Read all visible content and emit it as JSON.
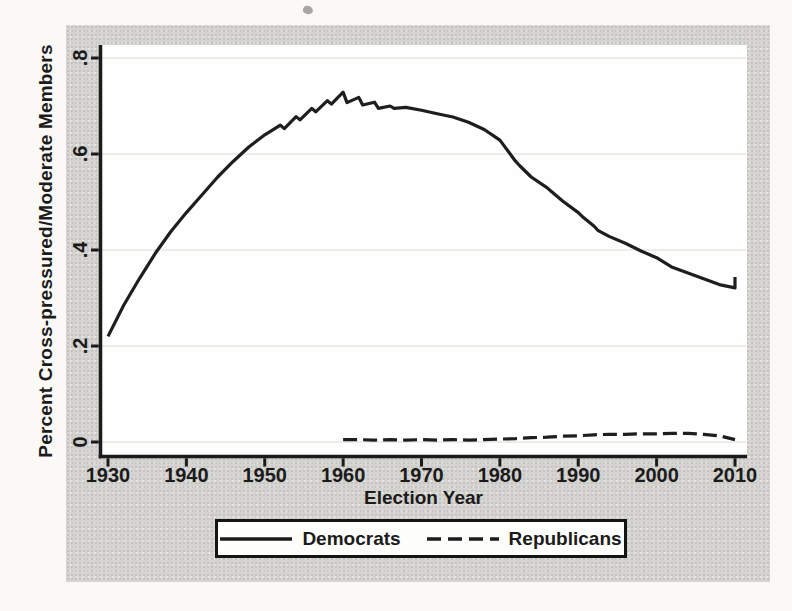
{
  "page": {
    "background": "#faf9f6"
  },
  "figure": {
    "background": "#d5d4d1",
    "plot_background": "#fefefe",
    "axis_color": "#1b1b1b",
    "grid_color": "#eae6e1",
    "line_color": "#1e1e1e"
  },
  "chart_data": {
    "type": "line",
    "title": "",
    "xlabel": "Election Year",
    "ylabel": "Percent Cross-pressured/Moderate Members",
    "xlim": [
      1930,
      2010
    ],
    "ylim": [
      0,
      0.8
    ],
    "xticks": [
      1930,
      1940,
      1950,
      1960,
      1970,
      1980,
      1990,
      2000,
      2010
    ],
    "yticks": [
      0,
      0.2,
      0.4,
      0.6,
      0.8
    ],
    "ytick_labels": [
      "0",
      ".2",
      ".4",
      ".6",
      ".8"
    ],
    "grid": "horizontal",
    "legend_position": "bottom-center",
    "series": [
      {
        "name": "Democrats",
        "style": "solid",
        "color": "#1e1e1e",
        "points": [
          [
            1930,
            0.22
          ],
          [
            1932,
            0.285
          ],
          [
            1934,
            0.34
          ],
          [
            1936,
            0.392
          ],
          [
            1938,
            0.438
          ],
          [
            1940,
            0.478
          ],
          [
            1942,
            0.515
          ],
          [
            1944,
            0.552
          ],
          [
            1946,
            0.585
          ],
          [
            1948,
            0.615
          ],
          [
            1950,
            0.64
          ],
          [
            1952,
            0.66
          ],
          [
            1952.5,
            0.653
          ],
          [
            1954,
            0.678
          ],
          [
            1954.5,
            0.671
          ],
          [
            1956,
            0.695
          ],
          [
            1956.5,
            0.688
          ],
          [
            1958,
            0.711
          ],
          [
            1958.5,
            0.704
          ],
          [
            1960,
            0.729
          ],
          [
            1960.5,
            0.707
          ],
          [
            1962,
            0.718
          ],
          [
            1962.5,
            0.702
          ],
          [
            1964,
            0.708
          ],
          [
            1964.5,
            0.695
          ],
          [
            1966,
            0.7
          ],
          [
            1966.5,
            0.695
          ],
          [
            1968,
            0.697
          ],
          [
            1970,
            0.691
          ],
          [
            1972,
            0.684
          ],
          [
            1974,
            0.677
          ],
          [
            1976,
            0.666
          ],
          [
            1978,
            0.651
          ],
          [
            1980,
            0.629
          ],
          [
            1982,
            0.585
          ],
          [
            1982.5,
            0.576
          ],
          [
            1984,
            0.552
          ],
          [
            1986,
            0.53
          ],
          [
            1986.5,
            0.523
          ],
          [
            1988,
            0.502
          ],
          [
            1990,
            0.478
          ],
          [
            1990.5,
            0.47
          ],
          [
            1992,
            0.45
          ],
          [
            1992.5,
            0.441
          ],
          [
            1994,
            0.428
          ],
          [
            1996,
            0.414
          ],
          [
            1998,
            0.398
          ],
          [
            2000,
            0.384
          ],
          [
            2002,
            0.364
          ],
          [
            2004,
            0.352
          ],
          [
            2006,
            0.34
          ],
          [
            2008,
            0.328
          ],
          [
            2010,
            0.321
          ],
          [
            2010,
            0.344
          ]
        ]
      },
      {
        "name": "Republicans",
        "style": "dashed",
        "color": "#1e1e1e",
        "points": [
          [
            1960,
            0.005
          ],
          [
            1962,
            0.005
          ],
          [
            1964,
            0.004
          ],
          [
            1966,
            0.005
          ],
          [
            1968,
            0.004
          ],
          [
            1970,
            0.005
          ],
          [
            1972,
            0.004
          ],
          [
            1974,
            0.005
          ],
          [
            1976,
            0.004
          ],
          [
            1978,
            0.005
          ],
          [
            1980,
            0.006
          ],
          [
            1982,
            0.007
          ],
          [
            1984,
            0.009
          ],
          [
            1986,
            0.01
          ],
          [
            1988,
            0.012
          ],
          [
            1990,
            0.013
          ],
          [
            1992,
            0.015
          ],
          [
            1994,
            0.016
          ],
          [
            1996,
            0.016
          ],
          [
            1998,
            0.017
          ],
          [
            2000,
            0.017
          ],
          [
            2002,
            0.018
          ],
          [
            2004,
            0.018
          ],
          [
            2006,
            0.016
          ],
          [
            2008,
            0.013
          ],
          [
            2010,
            0.005
          ]
        ]
      }
    ]
  }
}
